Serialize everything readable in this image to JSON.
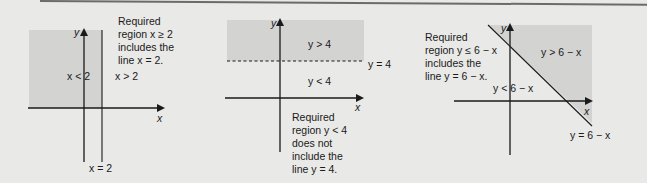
{
  "colors": {
    "panel_bg": "#e9e9e7",
    "shaded_region": "#d3d3d2",
    "axis": "#1a1a1a",
    "text": "#1a1a1a",
    "top_rule": "#6b6b6b"
  },
  "diagrams": [
    {
      "id": "x-ge-2",
      "note_lines": [
        "Required",
        "region x ≥ 2",
        "includes the",
        "line x = 2."
      ],
      "region_labels": {
        "left": "x < 2",
        "right": "x > 2"
      },
      "boundary_label": "x = 2",
      "boundary_style": "solid",
      "axis_labels": {
        "x": "x",
        "y": "y"
      }
    },
    {
      "id": "y-lt-4",
      "region_labels": {
        "above": "y > 4",
        "below": "y < 4"
      },
      "boundary_label": "y = 4",
      "boundary_style": "dashed",
      "note_lines": [
        "Required",
        "region y < 4",
        "does not",
        "include the",
        "line y = 4."
      ],
      "axis_labels": {
        "x": "x",
        "y": "y"
      }
    },
    {
      "id": "y-le-6-minus-x",
      "note_lines": [
        "Required",
        "region y ≤ 6 − x",
        "includes the",
        "line y = 6 − x."
      ],
      "region_labels": {
        "above": "y > 6 − x",
        "below": "y < 6 − x"
      },
      "boundary_label": "y = 6 − x",
      "boundary_style": "solid",
      "axis_labels": {
        "x": "x",
        "y": "y"
      }
    }
  ]
}
